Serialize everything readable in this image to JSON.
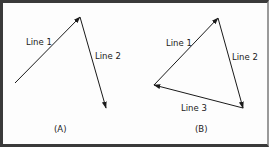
{
  "diagram": {
    "panels": [
      {
        "caption": "(A)",
        "lines": [
          {
            "label": "Line 1",
            "from": [
              15,
              83
            ],
            "to": [
              80,
              17
            ]
          },
          {
            "label": "Line 2",
            "from": [
              80,
              17
            ],
            "to": [
              106,
              108
            ]
          }
        ]
      },
      {
        "caption": "(B)",
        "lines": [
          {
            "label": "Line 1",
            "from": [
              154,
              85
            ],
            "to": [
              218,
              18
            ]
          },
          {
            "label": "Line 2",
            "from": [
              218,
              18
            ],
            "to": [
              243,
              108
            ]
          },
          {
            "label": "Line 3",
            "from": [
              243,
              108
            ],
            "to": [
              154,
              85
            ]
          }
        ]
      }
    ],
    "colors": {
      "line": "#1a1a1a",
      "border": "#3a3a3a",
      "background": "#fdfdfd"
    }
  }
}
